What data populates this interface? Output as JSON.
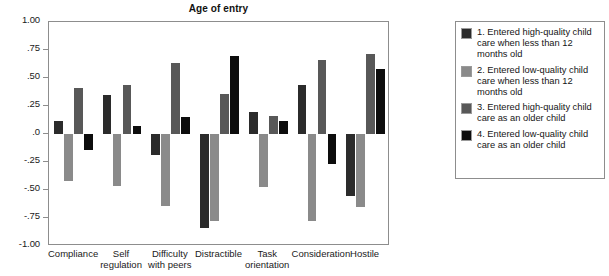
{
  "chart_data": {
    "type": "bar",
    "title": "Age of entry",
    "xlabel": "",
    "ylabel": "",
    "ylim": [
      -1.0,
      1.0
    ],
    "grid": false,
    "legend_position": "right",
    "ytick_labels": [
      "1.00",
      ".75",
      ".50",
      ".25",
      ".0",
      "-.25",
      "-.50",
      "-.75",
      "-1.00"
    ],
    "ytick_values": [
      1.0,
      0.75,
      0.5,
      0.25,
      0.0,
      -0.25,
      -0.5,
      -0.75,
      -1.0
    ],
    "categories": [
      "Compliance",
      "Self regulation",
      "Difficulty with peers",
      "Distractible",
      "Task orientation",
      "Consideration",
      "Hostile"
    ],
    "category_lines": [
      [
        "Compliance"
      ],
      [
        "Self",
        "regulation"
      ],
      [
        "Difficulty",
        "with peers"
      ],
      [
        "Distractible"
      ],
      [
        "Task",
        "orientation"
      ],
      [
        "Consideration"
      ],
      [
        "Hostile"
      ]
    ],
    "series": [
      {
        "name": "1. Entered high-quality child care when less than 12 months old",
        "color": "#2b2b2b",
        "values": [
          0.12,
          0.35,
          -0.19,
          -0.84,
          0.2,
          0.44,
          -0.55
        ]
      },
      {
        "name": "2. Entered low-quality child care when less than 12 months old",
        "color": "#8a8a8a",
        "values": [
          -0.42,
          -0.46,
          -0.64,
          -0.78,
          -0.47,
          -0.78,
          -0.65
        ]
      },
      {
        "name": "3. Entered high-quality child care as an older child",
        "color": "#585858",
        "values": [
          0.41,
          0.44,
          0.63,
          0.36,
          0.16,
          0.66,
          0.71
        ]
      },
      {
        "name": "4. Entered low-quality child care as an older child",
        "color": "#0d0d0d",
        "values": [
          -0.14,
          0.07,
          0.15,
          0.7,
          0.12,
          -0.27,
          0.58
        ]
      }
    ]
  },
  "legend": {
    "items": [
      {
        "swatch": "series-1-swatch",
        "label": "1. Entered high-quality child care when less than 12 months old"
      },
      {
        "swatch": "series-2-swatch",
        "label": "2. Entered low-quality child care when less than 12 months old"
      },
      {
        "swatch": "series-3-swatch",
        "label": "3. Entered high-quality child care as an older child"
      },
      {
        "swatch": "series-4-swatch",
        "label": "4. Entered low-quality child care as an older child"
      }
    ]
  },
  "colors": {
    "series1": "#2b2b2b",
    "series2": "#8a8a8a",
    "series3": "#585858",
    "series4": "#0d0d0d",
    "axis": "#8d8d8d",
    "text": "#1a1a1a",
    "background": "#ffffff"
  }
}
